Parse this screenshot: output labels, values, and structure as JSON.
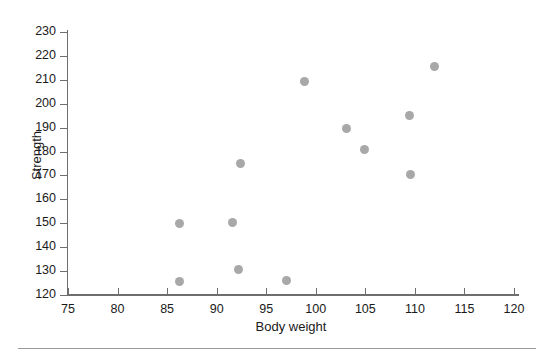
{
  "chart_data": {
    "type": "scatter",
    "title": "",
    "xlabel": "Body weight",
    "ylabel": "Strength",
    "xlim": [
      75,
      120
    ],
    "ylim": [
      120,
      230
    ],
    "xticks": [
      75,
      80,
      85,
      90,
      95,
      100,
      105,
      110,
      115,
      120
    ],
    "yticks": [
      120,
      130,
      140,
      150,
      160,
      170,
      180,
      190,
      200,
      210,
      220,
      230
    ],
    "grid": false,
    "legend": null,
    "marker": {
      "shape": "circle",
      "color": "#a8a8a8",
      "size": 9
    },
    "series": [
      {
        "name": "observations",
        "x": [
          86.3,
          86.3,
          91.6,
          92.2,
          92.4,
          97.0,
          98.9,
          103.1,
          104.9,
          109.5,
          109.6,
          112.0
        ],
        "y": [
          125.7,
          150.0,
          150.5,
          130.5,
          175.0,
          126.0,
          209.5,
          189.5,
          181.0,
          195.0,
          170.5,
          215.5
        ],
        "points": [
          {
            "x": 86.3,
            "y": 125.7
          },
          {
            "x": 86.3,
            "y": 150.0
          },
          {
            "x": 91.6,
            "y": 150.5
          },
          {
            "x": 92.2,
            "y": 130.5
          },
          {
            "x": 92.4,
            "y": 175.0
          },
          {
            "x": 97.0,
            "y": 126.0
          },
          {
            "x": 98.9,
            "y": 209.5
          },
          {
            "x": 103.1,
            "y": 189.5
          },
          {
            "x": 104.9,
            "y": 181.0
          },
          {
            "x": 109.5,
            "y": 195.0
          },
          {
            "x": 109.6,
            "y": 170.5
          },
          {
            "x": 112.0,
            "y": 215.5
          }
        ]
      }
    ]
  },
  "colors": {
    "marker": "#a8a8a8",
    "axis": "#6e6e6e",
    "text": "#1a1a1a",
    "rule": "#9a9a9a",
    "background": "#ffffff"
  }
}
